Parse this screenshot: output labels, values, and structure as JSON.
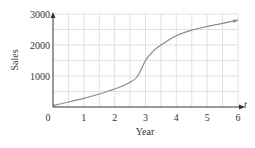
{
  "chart_data": {
    "type": "line",
    "title": "",
    "xlabel": "Year",
    "ylabel": "Sales",
    "x_axis_variable": "t",
    "xlim": [
      0,
      6
    ],
    "ylim": [
      0,
      3000
    ],
    "x_ticks": [
      0,
      1,
      2,
      3,
      4,
      5,
      6
    ],
    "x_tick_labels": [
      "0",
      "1",
      "2",
      "3",
      "4",
      "5",
      "6"
    ],
    "y_ticks": [
      1000,
      2000,
      3000
    ],
    "y_tick_labels": [
      "1000",
      "2000",
      "3000"
    ],
    "grid": true,
    "grid_step_x": 0.5,
    "grid_step_y": 500,
    "legend": null,
    "series": [
      {
        "name": "Sales",
        "x": [
          0,
          0.5,
          1,
          1.5,
          2,
          2.5,
          2.75,
          3,
          3.25,
          3.5,
          4,
          4.5,
          5,
          5.5,
          6
        ],
        "values": [
          50,
          160,
          280,
          420,
          580,
          800,
          1000,
          1500,
          1800,
          2000,
          2300,
          2480,
          2600,
          2700,
          2800
        ]
      }
    ],
    "colors": {
      "curve": "#8a8a8a",
      "axes": "#333333",
      "grid": "#d9d9d9"
    }
  }
}
